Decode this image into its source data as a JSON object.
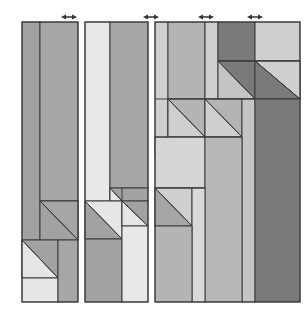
{
  "diagram": {
    "colors": {
      "background": "#ffffff",
      "stroke": "#3a3a3a",
      "light": "#e6e6e6",
      "lightmid": "#cfcfcf",
      "mid": "#b4b4b4",
      "midgray": "#a2a2a2",
      "dark": "#7a7a7a"
    },
    "arrows": [
      {
        "name": "arrow-panel-1",
        "x": 69,
        "y": 17
      },
      {
        "name": "arrow-panel-2",
        "x": 151,
        "y": 17
      },
      {
        "name": "arrow-panel-3",
        "x": 206,
        "y": 17
      },
      {
        "name": "arrow-panel-4",
        "x": 255,
        "y": 17
      }
    ],
    "panels": [
      {
        "name": "panel-1",
        "x": 22,
        "y": 22,
        "width": 56,
        "height": 280
      },
      {
        "name": "panel-2",
        "x": 85,
        "y": 22,
        "width": 63,
        "height": 280
      },
      {
        "name": "panel-3",
        "x": 155,
        "y": 22,
        "width": 145,
        "height": 280
      }
    ]
  }
}
